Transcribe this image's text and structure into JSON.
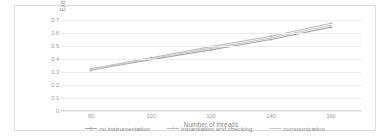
{
  "chart_data": {
    "type": "line",
    "title": "",
    "xlabel": "Number of threads",
    "ylabel": "Execution Time(s)",
    "x": [
      80,
      100,
      120,
      140,
      160
    ],
    "xtick_labels": [
      "80",
      "100",
      "120",
      "140",
      "160"
    ],
    "ytick_labels": [
      "0",
      "0.1",
      "0.2",
      "0.3",
      "0.4",
      "0.5",
      "0.6",
      "0.7"
    ],
    "ytick_values": [
      0,
      0.1,
      0.2,
      0.3,
      0.4,
      0.5,
      0.6,
      0.7
    ],
    "xlim": [
      70,
      170
    ],
    "ylim": [
      0,
      0.7
    ],
    "grid": true,
    "legend_position": "bottom",
    "series": [
      {
        "name": "no instrumentation",
        "color": "#a9a9a9",
        "marker": "cross",
        "values": [
          0.315,
          0.395,
          0.47,
          0.55,
          0.645
        ]
      },
      {
        "name": "instantiation and checking",
        "color": "#bdbdbd",
        "marker": "cross",
        "values": [
          0.325,
          0.41,
          0.495,
          0.575,
          0.675
        ]
      },
      {
        "name": "communication",
        "color": "#c9c9c9",
        "marker": "none",
        "values": [
          0.32,
          0.402,
          0.482,
          0.562,
          0.66
        ]
      }
    ]
  },
  "frame": {
    "border_color": "#dedede",
    "background": "#ffffff"
  }
}
